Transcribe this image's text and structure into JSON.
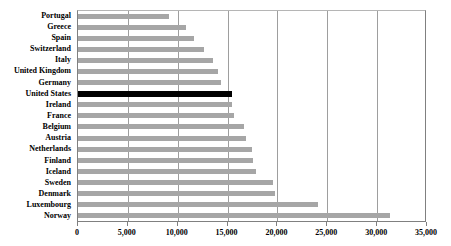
{
  "chart_data": {
    "type": "bar",
    "orientation": "horizontal",
    "title": "",
    "xlabel": "",
    "ylabel": "",
    "xlim": [
      0,
      35000
    ],
    "xticks": [
      0,
      5000,
      10000,
      15000,
      20000,
      25000,
      30000,
      35000
    ],
    "xtick_labels": [
      "0",
      "5,000",
      "10,000",
      "15,000",
      "20,000",
      "25,000",
      "30,000",
      "35,000"
    ],
    "grid": true,
    "legend": "none",
    "bar_color": "#a6a6a6",
    "highlight_color": "#000000",
    "highlight_category": "United States",
    "categories": [
      "Portugal",
      "Greece",
      "Spain",
      "Switzerland",
      "Italy",
      "United Kingdom",
      "Germany",
      "United States",
      "Ireland",
      "France",
      "Belgium",
      "Austria",
      "Netherlands",
      "Finland",
      "Iceland",
      "Sweden",
      "Denmark",
      "Luxembourg",
      "Norway"
    ],
    "values": [
      9100,
      10800,
      11600,
      12600,
      13500,
      14000,
      14300,
      15400,
      15400,
      15600,
      16600,
      16800,
      17400,
      17500,
      17900,
      19600,
      19800,
      24100,
      31300
    ]
  }
}
